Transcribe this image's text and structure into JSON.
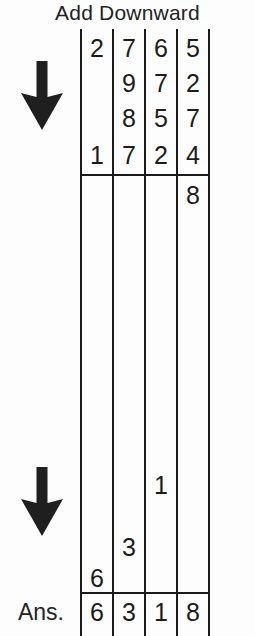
{
  "worksheet": {
    "title": "Add Downward",
    "answer_label": "Ans.",
    "arrows": [
      {
        "name": "down-arrow-top",
        "direction": "down"
      },
      {
        "name": "down-arrow-bottom",
        "direction": "down"
      }
    ],
    "columns": [
      "thousands",
      "hundreds",
      "tens",
      "ones"
    ],
    "addend_rows": [
      {
        "digits": [
          "2",
          "7",
          "6",
          "5"
        ]
      },
      {
        "digits": [
          "",
          "9",
          "7",
          "2"
        ]
      },
      {
        "digits": [
          "",
          "8",
          "5",
          "7"
        ]
      },
      {
        "digits": [
          "1",
          "7",
          "2",
          "4"
        ]
      }
    ],
    "partial_sums": [
      {
        "column": "ones",
        "value": "8"
      },
      {
        "column": "tens",
        "value": "1"
      },
      {
        "column": "hundreds",
        "value": "3"
      },
      {
        "column": "thousands",
        "value": "6"
      }
    ],
    "answer_row": {
      "digits": [
        "6",
        "3",
        "1",
        "8"
      ]
    },
    "ink_color": "#1b1b1b",
    "paper_color": "#fdfdfd"
  }
}
